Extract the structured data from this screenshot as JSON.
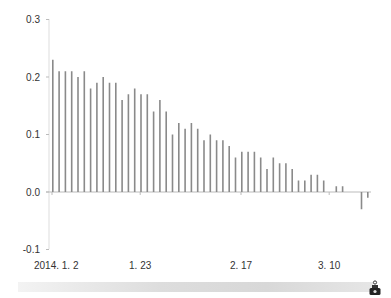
{
  "chart_data": {
    "type": "bar",
    "title": "",
    "xlabel": "",
    "ylabel": "",
    "ylim": [
      -0.1,
      0.3
    ],
    "yticks": [
      "0.3",
      "0.2",
      "0.1",
      "0.0",
      "-0.1"
    ],
    "ytick_values": [
      0.3,
      0.2,
      0.1,
      0.0,
      -0.1
    ],
    "xtick_labels": [
      "2014. 1. 2",
      "1. 23",
      "2. 17",
      "3. 10"
    ],
    "xtick_indices": [
      0,
      14,
      30,
      44
    ],
    "grid": false,
    "legend": null,
    "bar_color": "#8a8a8a",
    "axis_color": "#bbbbbb",
    "series": [
      {
        "name": "value",
        "values": [
          0.23,
          0.21,
          0.21,
          0.21,
          0.2,
          0.21,
          0.18,
          0.19,
          0.2,
          0.19,
          0.19,
          0.16,
          0.17,
          0.18,
          0.17,
          0.17,
          0.14,
          0.16,
          0.14,
          0.1,
          0.12,
          0.11,
          0.12,
          0.11,
          0.09,
          0.1,
          0.09,
          0.09,
          0.08,
          0.06,
          0.07,
          0.07,
          0.07,
          0.06,
          0.04,
          0.06,
          0.05,
          0.05,
          0.04,
          0.02,
          0.02,
          0.03,
          0.03,
          0.02,
          0.0,
          0.01,
          0.01,
          0.0,
          0.0,
          -0.03,
          -0.01
        ]
      }
    ]
  },
  "footer": {
    "icon": "robot-icon"
  }
}
